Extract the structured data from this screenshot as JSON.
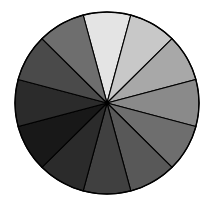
{
  "figure": {
    "title": "",
    "background_color": "#ffffff",
    "outline_color": "#000000",
    "center_x": 107,
    "center_y": 103,
    "radius_x": 92,
    "radius_y": 91
  },
  "chart_data": {
    "type": "pie",
    "title": "",
    "subtitle": "",
    "xlabel": "",
    "ylabel": "",
    "grid": false,
    "legend_position": "none",
    "n_slices": 12,
    "slice_angle_deg": 30,
    "start_angle_deg": -105,
    "direction": "clockwise",
    "categories": [
      "slice-1",
      "slice-2",
      "slice-3",
      "slice-4",
      "slice-5",
      "slice-6",
      "slice-7",
      "slice-8",
      "slice-9",
      "slice-10",
      "slice-11",
      "slice-12"
    ],
    "values": [
      8.33,
      8.33,
      8.33,
      8.33,
      8.33,
      8.33,
      8.33,
      8.33,
      8.33,
      8.33,
      8.33,
      8.33
    ],
    "colors": [
      "#e4e4e4",
      "#c8c8c8",
      "#a8a8a8",
      "#8a8a8a",
      "#6e6e6e",
      "#585858",
      "#404040",
      "#2b2b2b",
      "#181818",
      "#2b2b2b",
      "#4a4a4a",
      "#6e6e6e"
    ],
    "slices": [
      {
        "label": "slice-1",
        "start_deg": -105,
        "end_deg": -75,
        "color": "#e4e4e4",
        "value": 8.33
      },
      {
        "label": "slice-2",
        "start_deg": -75,
        "end_deg": -45,
        "color": "#c8c8c8",
        "value": 8.33
      },
      {
        "label": "slice-3",
        "start_deg": -45,
        "end_deg": -15,
        "color": "#a8a8a8",
        "value": 8.33
      },
      {
        "label": "slice-4",
        "start_deg": -15,
        "end_deg": 15,
        "color": "#8a8a8a",
        "value": 8.33
      },
      {
        "label": "slice-5",
        "start_deg": 15,
        "end_deg": 45,
        "color": "#6e6e6e",
        "value": 8.33
      },
      {
        "label": "slice-6",
        "start_deg": 45,
        "end_deg": 75,
        "color": "#585858",
        "value": 8.33
      },
      {
        "label": "slice-7",
        "start_deg": 75,
        "end_deg": 105,
        "color": "#404040",
        "value": 8.33
      },
      {
        "label": "slice-8",
        "start_deg": 105,
        "end_deg": 135,
        "color": "#2b2b2b",
        "value": 8.33
      },
      {
        "label": "slice-9",
        "start_deg": 135,
        "end_deg": 165,
        "color": "#181818",
        "value": 8.33
      },
      {
        "label": "slice-10",
        "start_deg": 165,
        "end_deg": 195,
        "color": "#2b2b2b",
        "value": 8.33
      },
      {
        "label": "slice-11",
        "start_deg": 195,
        "end_deg": 225,
        "color": "#4a4a4a",
        "value": 8.33
      },
      {
        "label": "slice-12",
        "start_deg": 225,
        "end_deg": 255,
        "color": "#6e6e6e",
        "value": 8.33
      }
    ]
  }
}
